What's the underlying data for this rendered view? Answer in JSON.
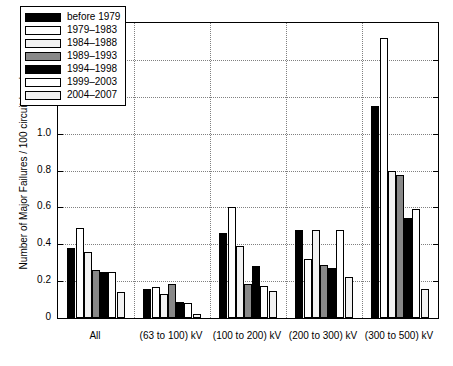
{
  "chart_data": {
    "type": "bar",
    "title": "",
    "xlabel": "",
    "ylabel": "Number of Major Failures / 100 circuit-breaker-years",
    "ylim": [
      0,
      1.6
    ],
    "yticks": [
      "0",
      "0.2",
      "0.4",
      "0.6",
      "0.8",
      "1.0",
      "1.2",
      "1.4",
      "1.6"
    ],
    "ytick_values": [
      0,
      0.2,
      0.4,
      0.6,
      0.8,
      1.0,
      1.2,
      1.4,
      1.6
    ],
    "grid": true,
    "legend_position": "upper-left",
    "categories": [
      "All",
      "(63 to 100) kV",
      "(100 to 200) kV",
      "(200 to 300) kV",
      "(300 to 500) kV"
    ],
    "series": [
      {
        "name": "before 1979",
        "color": "#000000",
        "values": [
          0.38,
          0.16,
          0.46,
          0.48,
          1.15
        ]
      },
      {
        "name": "1979–1983",
        "color": "#ffffff",
        "values": [
          0.49,
          0.17,
          0.6,
          0.32,
          1.52
        ]
      },
      {
        "name": "1984–1988",
        "color": "#f2f2f2",
        "values": [
          0.36,
          0.13,
          0.39,
          0.48,
          0.8
        ]
      },
      {
        "name": "1989–1993",
        "color": "#888888",
        "values": [
          0.26,
          0.185,
          0.185,
          0.29,
          0.775
        ]
      },
      {
        "name": "1994–1998",
        "color": "#000000",
        "values": [
          0.25,
          0.085,
          0.28,
          0.27,
          0.54
        ]
      },
      {
        "name": "1999–2003",
        "color": "#ffffff",
        "values": [
          0.25,
          0.08,
          0.175,
          0.48,
          0.59
        ]
      },
      {
        "name": "2004–2007",
        "color": "#f2f2f2",
        "values": [
          0.14,
          0.02,
          0.145,
          0.22,
          0.16
        ]
      }
    ]
  }
}
